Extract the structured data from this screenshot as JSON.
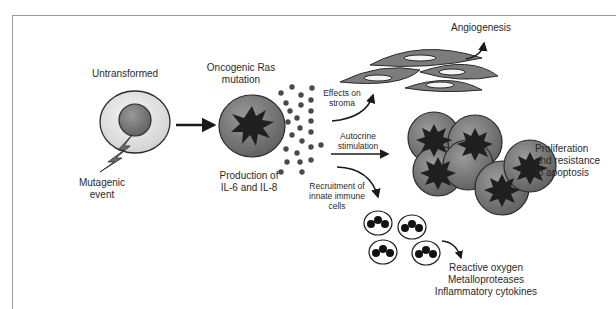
{
  "diagram": {
    "labels": {
      "untransformed": "Untransformed",
      "mutagenic_event_1": "Mutagenic",
      "mutagenic_event_2": "event",
      "oncogenic_1": "Oncogenic Ras",
      "oncogenic_2": "mutation",
      "production_1": "Production of",
      "production_2": "IL-6 and IL-8",
      "effects_1": "Effects on",
      "effects_2": "stroma",
      "angiogenesis": "Angiogenesis",
      "autocrine_1": "Autocrine",
      "autocrine_2": "stimulation",
      "proliferation_1": "Proliferation",
      "proliferation_2": "and resistance",
      "proliferation_3": "to apoptosis",
      "recruitment_1": "Recruitment  of",
      "recruitment_2": "innate immune",
      "recruitment_3": "cells",
      "outcome_1": "Reactive oxygen",
      "outcome_2": "Metalloproteases",
      "outcome_3": "Inflammatory cytokines"
    },
    "colors": {
      "cell_gray": "#7a7a7a",
      "cell_dark": "#3a3a3a",
      "outer_ring": "#e4e4e4",
      "dot": "#4a4a4a",
      "frame": "#9a9a9a",
      "text": "#2a2a2a"
    }
  }
}
